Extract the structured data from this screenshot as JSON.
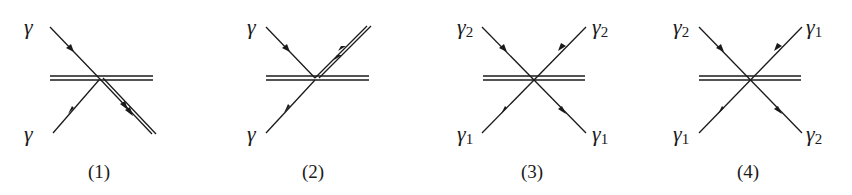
{
  "diagrams": [
    {
      "caption": "(1)",
      "labels": {
        "top_left": "γ",
        "bottom_left": "γ",
        "top_left_sub": "",
        "bottom_left_sub": ""
      },
      "description": "Two photons absorbed; outgoing double line down-right"
    },
    {
      "caption": "(2)",
      "labels": {
        "top_left": "γ",
        "bottom_left": "γ",
        "top_left_sub": "",
        "bottom_left_sub": ""
      },
      "description": "Two photons absorbed; outgoing double line up-right"
    },
    {
      "caption": "(3)",
      "labels": {
        "top_left": "γ",
        "top_left_sub": "2",
        "top_right": "γ",
        "top_right_sub": "2",
        "bottom_left": "γ",
        "bottom_left_sub": "1",
        "bottom_right": "γ",
        "bottom_right_sub": "1"
      }
    },
    {
      "caption": "(4)",
      "labels": {
        "top_left": "γ",
        "top_left_sub": "2",
        "top_right": "γ",
        "top_right_sub": "1",
        "bottom_left": "γ",
        "bottom_left_sub": "1",
        "bottom_right": "γ",
        "bottom_right_sub": "2"
      }
    }
  ]
}
